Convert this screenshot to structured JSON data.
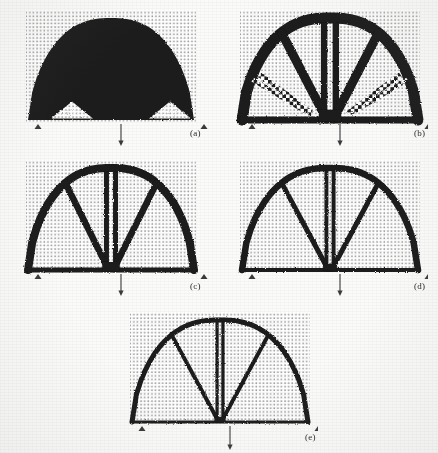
{
  "figure": {
    "background_color": "#fbfbfa",
    "material_color": "#1a1a1a",
    "intermediate_color": "#7d7d7d",
    "void_color": "#ffffff",
    "mesh_dot_color": "#9a9a96",
    "load_arrow_color": "#3a3a3a",
    "panel_count": 5
  },
  "panels": [
    {
      "id": "a",
      "label": "(a)",
      "label_x": 190,
      "label_y": 128,
      "origin_x": 18,
      "origin_y": 8,
      "width": 190,
      "height": 140,
      "domain_x": 10,
      "domain_y": 4,
      "domain_w": 166,
      "domain_h": 108,
      "mesh_spacing": 3.6,
      "description": "Nearly solid black dome with two small triangular white voids near the supports",
      "member_thickness": "solid",
      "volume_fraction_appearance": "high",
      "load": {
        "type": "point-load",
        "direction": "down",
        "x": 93,
        "y_start": 112,
        "y_end": 134
      },
      "supports": [
        {
          "type": "pin",
          "x": 10,
          "y": 112
        },
        {
          "type": "pin",
          "x": 176,
          "y": 112
        }
      ],
      "shape": "solid-dome",
      "voids": [
        {
          "type": "triangle",
          "cx": 44,
          "cy": 98,
          "half_width": 21,
          "height": 17
        },
        {
          "type": "triangle",
          "cx": 142,
          "cy": 98,
          "half_width": 21,
          "height": 17
        }
      ]
    },
    {
      "id": "b",
      "label": "(b)",
      "label_x": 414,
      "label_y": 128,
      "origin_x": 232,
      "origin_y": 8,
      "width": 196,
      "height": 140,
      "domain_x": 10,
      "domain_y": 4,
      "domain_w": 176,
      "domain_h": 108,
      "mesh_spacing": 3.6,
      "description": "Arch with thick curved outer rib, central column and two diagonal braces; checkered intermediate-density diagonals remain inside the side bays",
      "member_thickness": "thick",
      "volume_fraction_appearance": "medium-high",
      "load": {
        "type": "point-load",
        "direction": "down",
        "x": 98,
        "y_start": 112,
        "y_end": 134
      },
      "supports": [
        {
          "type": "pin",
          "x": 10,
          "y": 112
        },
        {
          "type": "pin",
          "x": 186,
          "y": 112
        }
      ],
      "shape": "fan-truss-with-gray-members",
      "has_intermediate_density": true
    },
    {
      "id": "c",
      "label": "(c)",
      "label_x": 190,
      "label_y": 281,
      "origin_x": 18,
      "origin_y": 158,
      "width": 190,
      "height": 140,
      "domain_x": 10,
      "domain_y": 4,
      "domain_w": 166,
      "domain_h": 108,
      "mesh_spacing": 3.6,
      "description": "Clean fan truss: curved upper chord, horizontal lower chord, vertical central column, two inclined braces",
      "member_thickness": "medium",
      "volume_fraction_appearance": "medium",
      "load": {
        "type": "point-load",
        "direction": "down",
        "x": 93,
        "y_start": 112,
        "y_end": 134
      },
      "supports": [
        {
          "type": "pin",
          "x": 10,
          "y": 112
        },
        {
          "type": "pin",
          "x": 176,
          "y": 112
        }
      ],
      "shape": "fan-truss",
      "has_intermediate_density": false
    },
    {
      "id": "d",
      "label": "(d)",
      "label_x": 414,
      "label_y": 281,
      "origin_x": 232,
      "origin_y": 158,
      "width": 196,
      "height": 140,
      "domain_x": 10,
      "domain_y": 4,
      "domain_w": 176,
      "domain_h": 108,
      "mesh_spacing": 3.6,
      "description": "Same fan truss as (c) with slimmer members and sharper member boundaries",
      "member_thickness": "medium-thin",
      "volume_fraction_appearance": "medium-low",
      "load": {
        "type": "point-load",
        "direction": "down",
        "x": 98,
        "y_start": 112,
        "y_end": 134
      },
      "supports": [
        {
          "type": "pin",
          "x": 10,
          "y": 112
        },
        {
          "type": "pin",
          "x": 186,
          "y": 112
        }
      ],
      "shape": "fan-truss",
      "has_intermediate_density": false
    },
    {
      "id": "e",
      "label": "(e)",
      "label_x": 305,
      "label_y": 432,
      "origin_x": 122,
      "origin_y": 310,
      "width": 196,
      "height": 143,
      "domain_x": 10,
      "domain_y": 4,
      "domain_w": 176,
      "domain_h": 108,
      "mesh_spacing": 3.6,
      "description": "Finest fan truss with the thinnest members; crisp black-and-white topology",
      "member_thickness": "thin",
      "volume_fraction_appearance": "low",
      "load": {
        "type": "point-load",
        "direction": "down",
        "x": 98,
        "y_start": 112,
        "y_end": 136
      },
      "supports": [
        {
          "type": "pin",
          "x": 10,
          "y": 112
        },
        {
          "type": "pin",
          "x": 186,
          "y": 112
        }
      ],
      "shape": "fan-truss",
      "has_intermediate_density": false
    }
  ]
}
